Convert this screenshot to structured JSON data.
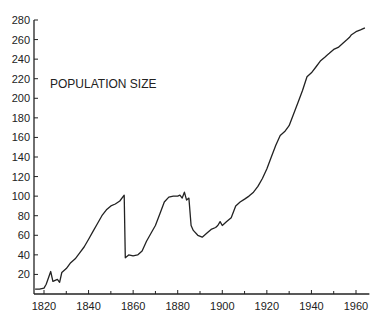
{
  "chart_data": {
    "type": "line",
    "title": "",
    "annotation": "POPULATION SIZE",
    "xlabel": "",
    "ylabel": "",
    "xlim": [
      1816,
      1966
    ],
    "ylim": [
      0,
      280
    ],
    "grid": false,
    "legend": null,
    "x_ticks": [
      1820,
      1840,
      1860,
      1880,
      1900,
      1920,
      1940,
      1960
    ],
    "x_minor_ticks": [
      1830,
      1850,
      1870,
      1890,
      1910,
      1930,
      1950
    ],
    "y_ticks": [
      20,
      40,
      60,
      80,
      100,
      120,
      140,
      160,
      180,
      200,
      220,
      240,
      260,
      280
    ],
    "series": [
      {
        "name": "Population size",
        "color": "#222222",
        "x": [
          1816,
          1818,
          1820,
          1821,
          1823,
          1824,
          1826,
          1827,
          1828,
          1830,
          1832,
          1834,
          1836,
          1838,
          1840,
          1842,
          1844,
          1846,
          1848,
          1850,
          1852,
          1854,
          1856,
          1856.5,
          1858,
          1860,
          1862,
          1864,
          1866,
          1868,
          1870,
          1872,
          1874,
          1876,
          1878,
          1880,
          1881,
          1882,
          1883,
          1884,
          1885,
          1886,
          1887,
          1889,
          1891,
          1893,
          1895,
          1897,
          1898,
          1899,
          1900,
          1902,
          1904,
          1906,
          1908,
          1910,
          1912,
          1914,
          1916,
          1918,
          1920,
          1922,
          1924,
          1926,
          1928,
          1930,
          1932,
          1934,
          1936,
          1938,
          1940,
          1942,
          1944,
          1946,
          1947,
          1948,
          1950,
          1952,
          1954,
          1956,
          1957,
          1958,
          1960,
          1962,
          1964
        ],
        "y": [
          5,
          5,
          6,
          10,
          23,
          13,
          15,
          12,
          22,
          26,
          32,
          36,
          42,
          48,
          56,
          64,
          72,
          80,
          86,
          90,
          92,
          95,
          101,
          37,
          40,
          39,
          40,
          44,
          54,
          62,
          70,
          82,
          94,
          99,
          100,
          100,
          101,
          98,
          104,
          96,
          98,
          70,
          65,
          60,
          58,
          62,
          66,
          68,
          70,
          74,
          70,
          74,
          78,
          90,
          94,
          97,
          100,
          104,
          110,
          118,
          128,
          140,
          152,
          162,
          166,
          172,
          184,
          196,
          208,
          222,
          226,
          232,
          238,
          242,
          244,
          246,
          250,
          252,
          256,
          260,
          262,
          265,
          268,
          270,
          272
        ]
      }
    ]
  }
}
